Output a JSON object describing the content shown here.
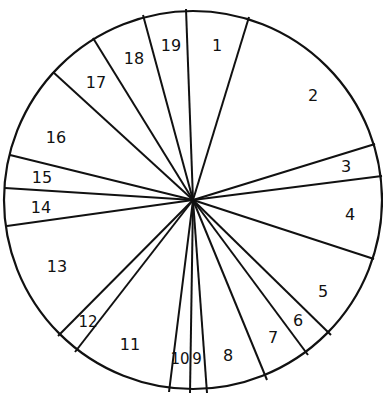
{
  "diagram": {
    "type": "segmented-circle",
    "stroke_color": "#111111",
    "background_color": "#ffffff",
    "center": {
      "x": 193,
      "y": 200
    },
    "radius": 189,
    "boundaries": [
      {
        "between": "19|1",
        "x": 186,
        "y": 9
      },
      {
        "between": "1|2",
        "x": 249,
        "y": 17
      },
      {
        "between": "2|3",
        "x": 375,
        "y": 144
      },
      {
        "between": "3|4",
        "x": 382,
        "y": 176
      },
      {
        "between": "4|5",
        "x": 374,
        "y": 259
      },
      {
        "between": "5|6",
        "x": 331,
        "y": 335
      },
      {
        "between": "6|7",
        "x": 308,
        "y": 355
      },
      {
        "between": "7|8",
        "x": 267,
        "y": 380
      },
      {
        "between": "8|9",
        "x": 207,
        "y": 393
      },
      {
        "between": "9|10",
        "x": 190,
        "y": 393
      },
      {
        "between": "10|11",
        "x": 169,
        "y": 392
      },
      {
        "between": "11|12",
        "x": 75,
        "y": 352
      },
      {
        "between": "12|13",
        "x": 58,
        "y": 336
      },
      {
        "between": "13|14",
        "x": 7,
        "y": 226
      },
      {
        "between": "14|15",
        "x": 5,
        "y": 188
      },
      {
        "between": "15|16",
        "x": 10,
        "y": 155
      },
      {
        "between": "16|17",
        "x": 53,
        "y": 72
      },
      {
        "between": "17|18",
        "x": 93,
        "y": 38
      },
      {
        "between": "18|19",
        "x": 143,
        "y": 15
      }
    ],
    "sectors": [
      {
        "label": "1",
        "x": 217,
        "y": 46
      },
      {
        "label": "2",
        "x": 313,
        "y": 96
      },
      {
        "label": "3",
        "x": 346,
        "y": 167
      },
      {
        "label": "4",
        "x": 350,
        "y": 215
      },
      {
        "label": "5",
        "x": 323,
        "y": 292
      },
      {
        "label": "6",
        "x": 298,
        "y": 321
      },
      {
        "label": "7",
        "x": 273,
        "y": 338
      },
      {
        "label": "8",
        "x": 228,
        "y": 356
      },
      {
        "label": "9",
        "x": 197,
        "y": 359
      },
      {
        "label": "10",
        "x": 180,
        "y": 359
      },
      {
        "label": "11",
        "x": 130,
        "y": 345
      },
      {
        "label": "12",
        "x": 88,
        "y": 322
      },
      {
        "label": "13",
        "x": 57,
        "y": 267
      },
      {
        "label": "14",
        "x": 41,
        "y": 208
      },
      {
        "label": "15",
        "x": 42,
        "y": 178
      },
      {
        "label": "16",
        "x": 56,
        "y": 138
      },
      {
        "label": "17",
        "x": 96,
        "y": 83
      },
      {
        "label": "18",
        "x": 134,
        "y": 59
      },
      {
        "label": "19",
        "x": 171,
        "y": 46
      }
    ]
  }
}
